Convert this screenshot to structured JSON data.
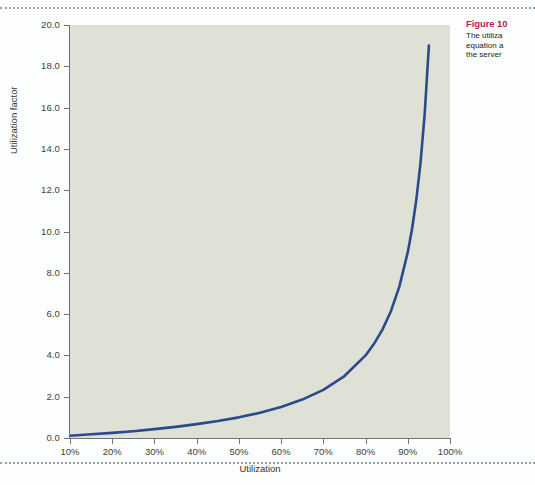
{
  "page": {
    "background_color": "#fcfdfd",
    "rule_color": "#9aa3ad"
  },
  "caption": {
    "title": "Figure 10",
    "lines": [
      "The utiliza",
      "equation a",
      "the server"
    ],
    "title_color": "#b51f57"
  },
  "chart_data": {
    "type": "line",
    "title": "",
    "xlabel": "Utilization",
    "ylabel": "Utilization factor",
    "xlim": [
      10,
      100
    ],
    "ylim": [
      0.0,
      20.0
    ],
    "grid": false,
    "legend": "none",
    "plot_background_color": "#dfe0d6",
    "line_color": "#2b4a8b",
    "line_width": 2.4,
    "x_tick_labels": [
      "10%",
      "20%",
      "30%",
      "40%",
      "50%",
      "60%",
      "70%",
      "80%",
      "90%",
      "100%"
    ],
    "x_ticks": [
      10,
      20,
      30,
      40,
      50,
      60,
      70,
      80,
      90,
      100
    ],
    "y_tick_labels": [
      "20.0",
      "18.0",
      "16.0",
      "14.0",
      "12.0",
      "10.0",
      "8.0",
      "6.0",
      "4.0",
      "2.0",
      "0.0"
    ],
    "y_ticks": [
      20.0,
      18.0,
      16.0,
      14.0,
      12.0,
      10.0,
      8.0,
      6.0,
      4.0,
      2.0,
      0.0
    ],
    "series": [
      {
        "name": "Utilization factor",
        "formula": "u / (1 - u)",
        "x": [
          10,
          15,
          20,
          25,
          30,
          35,
          40,
          45,
          50,
          55,
          60,
          65,
          70,
          75,
          80,
          82,
          84,
          86,
          88,
          90,
          91,
          92,
          93,
          94,
          95
        ],
        "values": [
          0.11,
          0.18,
          0.25,
          0.33,
          0.43,
          0.54,
          0.67,
          0.82,
          1.0,
          1.22,
          1.5,
          1.86,
          2.33,
          3.0,
          4.0,
          4.56,
          5.25,
          6.14,
          7.33,
          9.0,
          10.11,
          11.5,
          13.29,
          15.67,
          19.0
        ]
      }
    ]
  }
}
